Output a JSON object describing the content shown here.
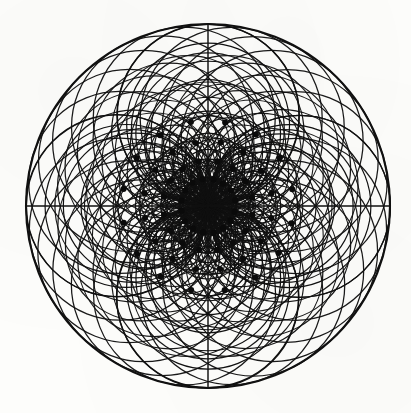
{
  "figure": {
    "title": "Dipole Coordinate Grid",
    "background_color": "#fdfdfb",
    "ink_color": "#101010",
    "dot_color": "#0a0a0a"
  },
  "geometry": {
    "canvas_width": 411,
    "canvas_height": 413,
    "center_x": 208,
    "center_y": 206,
    "outer_radius": 182,
    "outer_ring_stroke": 2.1,
    "curve_stroke": 1.45,
    "fine_stroke": 1.2,
    "dot_radius": 3.0
  },
  "chart_data": {
    "type": "scatter",
    "title": "Dipole Coordinate Grid",
    "xlabel": "",
    "ylabel": "",
    "grid": true,
    "legend": "none",
    "coordinate_system": "dipole (inverted polar)",
    "xlim": [
      -182,
      182
    ],
    "ylim": [
      -182,
      182
    ],
    "families": [
      {
        "name": "theta-family",
        "description": "Circles tangent at the origin to the vertical axis; the 'radial' lines of the inverted polar grid.",
        "count": 24,
        "angles_deg": [
          0,
          15,
          30,
          45,
          60,
          75,
          90,
          105,
          120,
          135,
          150,
          165,
          180,
          195,
          210,
          225,
          240,
          255,
          270,
          285,
          300,
          315,
          330,
          345
        ]
      },
      {
        "name": "rho-family",
        "description": "Circles tangent at the origin to the horizontal axis; the 'concentric' circles of the inverted polar grid.",
        "count": 11,
        "radii_fraction": [
          0.085,
          0.15,
          0.225,
          0.31,
          0.4,
          0.495,
          0.595,
          0.695,
          0.795,
          0.895,
          1.0
        ]
      }
    ],
    "dot_rings": [
      {
        "ring": 1,
        "radius_fraction": 0.15,
        "count": 16,
        "angle_offset_deg": 11.25
      },
      {
        "ring": 2,
        "radius_fraction": 0.248,
        "count": 16,
        "angle_offset_deg": 11.25
      },
      {
        "ring": 3,
        "radius_fraction": 0.352,
        "count": 16,
        "angle_offset_deg": 11.25
      },
      {
        "ring": 4,
        "radius_fraction": 0.47,
        "count": 16,
        "angle_offset_deg": 11.25
      }
    ],
    "axis_lines": [
      {
        "name": "horizontal-axis",
        "angle_deg": 0
      },
      {
        "name": "vertical-axis",
        "angle_deg": 90
      }
    ]
  }
}
